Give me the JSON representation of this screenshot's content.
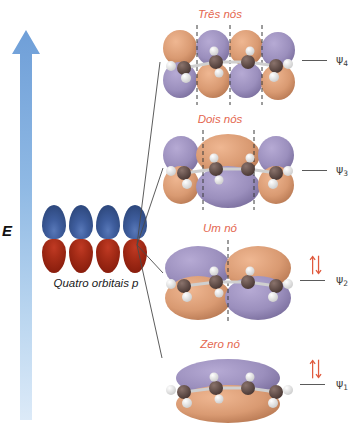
{
  "figure": {
    "type": "molecular-orbital-energy-diagram",
    "molecule": "1,3-butadiene",
    "language": "pt-BR",
    "axis": {
      "label": "E",
      "meaning": "energy-increasing-upward",
      "arrow_direction": "up",
      "color": "#7fa8dd"
    },
    "source_orbitals": {
      "caption": "Quatro orbitais p",
      "count": 4,
      "lobe_top_color": "#3f5e9e",
      "lobe_bottom_color": "#a82d18"
    },
    "accent_colors": {
      "node_label": "#e4674f",
      "orbital_positive": "#9b8fbd",
      "orbital_negative": "#d99a72",
      "electron_arrow": "#e05a3e",
      "level_line": "#5a5a5a",
      "carbon": "#5f4a45",
      "hydrogen": "#e8e8e8"
    },
    "levels": [
      {
        "id": "psi4",
        "psi_label": "ψ",
        "psi_sub": "4",
        "node_label": "Três nós",
        "nodes": 3,
        "electrons": 0,
        "occupancy_arrows": "",
        "type": "antibonding"
      },
      {
        "id": "psi3",
        "psi_label": "ψ",
        "psi_sub": "3",
        "node_label": "Dois nós",
        "nodes": 2,
        "electrons": 0,
        "occupancy_arrows": "",
        "type": "antibonding"
      },
      {
        "id": "psi2",
        "psi_label": "ψ",
        "psi_sub": "2",
        "node_label": "Um nó",
        "nodes": 1,
        "electrons": 2,
        "occupancy_arrows": "↑↓",
        "type": "bonding-HOMO"
      },
      {
        "id": "psi1",
        "psi_label": "ψ",
        "psi_sub": "1",
        "node_label": "Zero nó",
        "nodes": 0,
        "electrons": 2,
        "occupancy_arrows": "↑↓",
        "type": "bonding"
      }
    ]
  }
}
